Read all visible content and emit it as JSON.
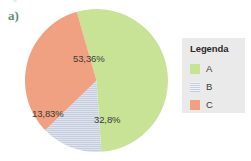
{
  "figure": {
    "item_label": "a)"
  },
  "chart_data": {
    "type": "pie",
    "title": "",
    "categories": [
      "A",
      "B",
      "C"
    ],
    "values": [
      53.36,
      13.83,
      32.8
    ],
    "labels": [
      "53,36%",
      "13,83%",
      "32,8%"
    ],
    "colors": [
      "#c8e396",
      "#c6cddf",
      "#f0a181"
    ],
    "legend_position": "right",
    "legend_title": "Legenda",
    "start_angle_deg": 106,
    "direction": "clockwise",
    "slices": [
      {
        "name": "A",
        "value": 53.36,
        "label": "53,36%",
        "color": "#c8e396",
        "pattern": "solid"
      },
      {
        "name": "B",
        "value": 13.83,
        "label": "13,83%",
        "color": "#c6cddf",
        "pattern": "horizontal-stripes"
      },
      {
        "name": "C",
        "value": 32.8,
        "label": "32,8%",
        "color": "#f0a181",
        "pattern": "solid"
      }
    ]
  },
  "legend": {
    "title": "Legenda",
    "items": [
      {
        "label": "A",
        "color": "#c8e396",
        "pattern": "solid"
      },
      {
        "label": "B",
        "color": "#c6cddf",
        "pattern": "horizontal-stripes"
      },
      {
        "label": "C",
        "color": "#f0a181",
        "pattern": "solid"
      }
    ]
  },
  "colors": {
    "slice_a": "#c8e396",
    "slice_b": "#c6cddf",
    "slice_c": "#f0a181",
    "legend_background": "#eaeaea",
    "item_label": "#5f8f78",
    "page_background": "#ffffff"
  }
}
